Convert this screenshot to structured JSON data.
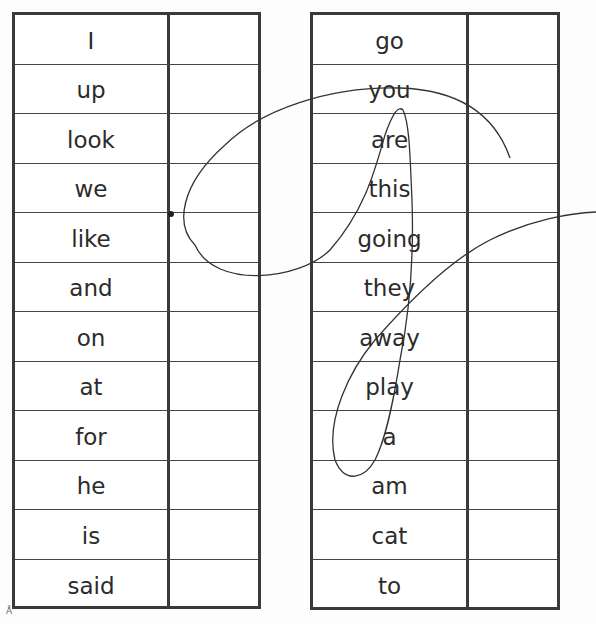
{
  "worksheet": {
    "left_column": {
      "words": [
        "I",
        "up",
        "look",
        "we",
        "like",
        "and",
        "on",
        "at",
        "for",
        "he",
        "is",
        "said"
      ]
    },
    "right_column": {
      "words": [
        "go",
        "you",
        "are",
        "this",
        "going",
        "they",
        "away",
        "play",
        "a",
        "am",
        "cat",
        "to"
      ]
    },
    "corner_mark": "Å",
    "colors": {
      "border": "#3a3a3a",
      "text": "#2b2b2b",
      "pen": "#333333"
    }
  }
}
